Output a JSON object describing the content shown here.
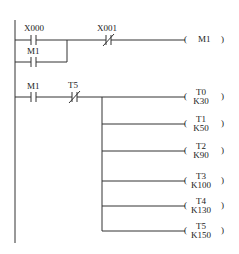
{
  "diagram": {
    "type": "PLC ladder diagram",
    "rungs": [
      {
        "contacts": [
          {
            "name": "X000",
            "type": "NO"
          },
          {
            "name": "M1",
            "type": "NO",
            "parallel_to": "X000"
          },
          {
            "name": "X001",
            "type": "NC"
          }
        ],
        "coil": {
          "name": "M1",
          "preset": ""
        }
      },
      {
        "contacts": [
          {
            "name": "M1",
            "type": "NO"
          },
          {
            "name": "T5",
            "type": "NC"
          }
        ],
        "coils": [
          {
            "name": "T0",
            "preset": "K30"
          },
          {
            "name": "T1",
            "preset": "K50"
          },
          {
            "name": "T2",
            "preset": "K90"
          },
          {
            "name": "T3",
            "preset": "K100"
          },
          {
            "name": "T4",
            "preset": "K130"
          },
          {
            "name": "T5",
            "preset": "K150"
          }
        ]
      }
    ]
  },
  "labels": {
    "x000": "X000",
    "m1_branch": "M1",
    "x001": "X001",
    "coil_m1": "M1",
    "m1_rung2": "M1",
    "t5_contact": "T5",
    "paren_open": "(",
    "paren_close": ")"
  }
}
